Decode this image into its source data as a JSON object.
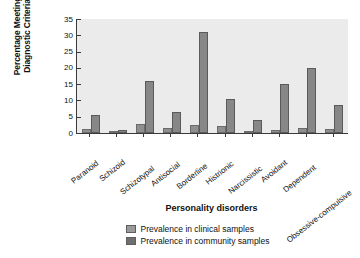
{
  "chart_data": {
    "type": "bar",
    "title": "",
    "xlabel": "Personality disorders",
    "ylabel": "Percentage Meeting Diagnostic Criteria",
    "ylabel_line1": "Percentage Meeting",
    "ylabel_line2": "Diagnostic Criteria",
    "ylim": [
      0,
      35
    ],
    "yticks": [
      0,
      5,
      10,
      15,
      20,
      25,
      30,
      35
    ],
    "ytick_labels": [
      "0",
      "5",
      "10",
      "15",
      "20",
      "25",
      "30",
      "35"
    ],
    "grid": false,
    "legend_position": "bottom-center",
    "categories": [
      "Paranoid",
      "Schizoid",
      "Schizotypal",
      "Antisocial",
      "Borderline",
      "Histrionic",
      "Narcissistic",
      "Avoidant",
      "Dependent",
      "Obsessive-compulsive"
    ],
    "series": [
      {
        "name": "Prevalence in clinical samples",
        "color": "#8f8f8f",
        "values": [
          1.3,
          0.6,
          2.8,
          1.5,
          2.5,
          2.2,
          0.6,
          1.0,
          1.5,
          1.3
        ]
      },
      {
        "name": "Prevalence in community samples",
        "color": "#878787",
        "values": [
          5.5,
          0.8,
          16.0,
          6.5,
          31.0,
          10.5,
          4.0,
          15.0,
          20.0,
          8.5
        ]
      }
    ]
  },
  "legend": {
    "items": [
      {
        "label": "Prevalence in clinical samples",
        "color": "#9a9a9a"
      },
      {
        "label": "Prevalence in community samples",
        "color": "#6f6f6f"
      }
    ]
  }
}
